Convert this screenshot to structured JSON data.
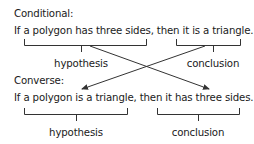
{
  "conditional": {
    "heading": "Conditional:",
    "sentence": "If a polygon has three sides, then it is a triangle.",
    "hypothesis_label": "hypothesis",
    "conclusion_label": "conclusion"
  },
  "converse": {
    "heading": "Converse:",
    "sentence": "If a polygon is a triangle, then it has three sides.",
    "hypothesis_label": "hypothesis",
    "conclusion_label": "conclusion"
  },
  "arrows": [
    {
      "from": "conditional.hypothesis",
      "to": "converse.conclusion"
    },
    {
      "from": "conditional.conclusion",
      "to": "converse.hypothesis"
    }
  ]
}
